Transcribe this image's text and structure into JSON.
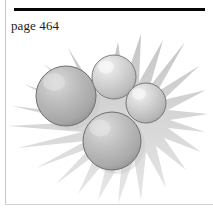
{
  "page": {
    "width": 213,
    "height": 210,
    "background_color": "#ffffff"
  },
  "header": {
    "rule_color": "#050505",
    "caption": "page 464"
  },
  "border": {
    "left_line_color": "#c9c9c9",
    "bottom_line_color": "#cfcfcf"
  },
  "figure": {
    "starburst": {
      "fill_color": "#d8d8d8",
      "shadow_color": "#bcbcbc",
      "spike_count": 28,
      "center_x": 107,
      "center_y": 88
    },
    "spheres": [
      {
        "name": "sphere-large-left",
        "cx": 66,
        "cy": 96,
        "r": 30,
        "fill_light": "#d2d2d2",
        "fill_mid": "#b4b4b4",
        "fill_dark": "#9a9a9a",
        "outline_color": "#6f6f6f",
        "highlight_x": 54,
        "highlight_y": 82
      },
      {
        "name": "sphere-top-center",
        "cx": 114,
        "cy": 77,
        "r": 22,
        "fill_light": "#ececec",
        "fill_mid": "#cfcfcf",
        "fill_dark": "#b0b0b0",
        "outline_color": "#7a7a7a",
        "highlight_x": 105,
        "highlight_y": 66
      },
      {
        "name": "sphere-right",
        "cx": 146,
        "cy": 103,
        "r": 20,
        "fill_light": "#eaeaea",
        "fill_mid": "#cdcdcd",
        "fill_dark": "#ababab",
        "outline_color": "#787878",
        "highlight_x": 138,
        "highlight_y": 93
      },
      {
        "name": "sphere-bottom-center",
        "cx": 112,
        "cy": 141,
        "r": 29,
        "fill_light": "#d6d6d6",
        "fill_mid": "#b8b8b8",
        "fill_dark": "#9d9d9d",
        "outline_color": "#6f6f6f",
        "highlight_x": 100,
        "highlight_y": 128
      }
    ]
  }
}
